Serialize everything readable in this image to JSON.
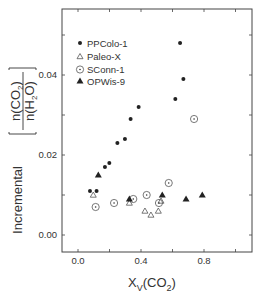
{
  "chart_data": {
    "type": "scatter",
    "title": "",
    "xlabel": "X_V(CO2)",
    "ylabel": "Incremental [n(CO2)/n(H2O)]",
    "xlim": [
      -0.1,
      1.105
    ],
    "ylim": [
      -0.0043,
      0.0565
    ],
    "xticks": [
      0.0,
      0.2,
      0.4,
      0.6,
      0.8,
      1.0
    ],
    "xtick_labels": [
      "0.0",
      "0.4",
      "0.8"
    ],
    "yticks": [
      0.0,
      0.01,
      0.02,
      0.03,
      0.04,
      0.05
    ],
    "ytick_labels": [
      "0.00",
      "0.02",
      "0.04"
    ],
    "grid": false,
    "legend_position": "upper left",
    "series": [
      {
        "name": "PPColo-1",
        "marker": "filled-circle",
        "points": [
          [
            0.076,
            0.011
          ],
          [
            0.118,
            0.011
          ],
          [
            0.171,
            0.017
          ],
          [
            0.199,
            0.018
          ],
          [
            0.25,
            0.023
          ],
          [
            0.298,
            0.024
          ],
          [
            0.334,
            0.029
          ],
          [
            0.385,
            0.032
          ],
          [
            0.618,
            0.034
          ],
          [
            0.648,
            0.048
          ],
          [
            0.669,
            0.039
          ]
        ]
      },
      {
        "name": "Paleo-X",
        "marker": "open-triangle",
        "points": [
          [
            0.097,
            0.01
          ],
          [
            0.326,
            0.008
          ],
          [
            0.425,
            0.006
          ],
          [
            0.463,
            0.005
          ],
          [
            0.51,
            0.006
          ],
          [
            0.527,
            0.0085
          ]
        ]
      },
      {
        "name": "SConn-1",
        "marker": "dotted-circle",
        "points": [
          [
            0.112,
            0.007
          ],
          [
            0.229,
            0.008
          ],
          [
            0.351,
            0.009
          ],
          [
            0.436,
            0.01
          ],
          [
            0.514,
            0.008
          ],
          [
            0.576,
            0.013
          ],
          [
            0.737,
            0.029
          ]
        ]
      },
      {
        "name": "OPWis-9",
        "marker": "filled-triangle",
        "points": [
          [
            0.129,
            0.015
          ],
          [
            0.326,
            0.009
          ],
          [
            0.535,
            0.01
          ],
          [
            0.686,
            0.009
          ],
          [
            0.789,
            0.01
          ]
        ]
      }
    ]
  },
  "axes": {
    "x_title_main": "X",
    "x_title_sub": "V",
    "x_title_rest": "(CO",
    "x_title_sub2": "2",
    "x_title_close": ")",
    "y_title_word": "Incremental",
    "y_frac_num": "n(CO",
    "y_frac_num_sub": "2",
    "y_frac_num_close": ")",
    "y_frac_den": "n(H",
    "y_frac_den_sub": "2",
    "y_frac_den_close": "O)"
  },
  "style": {
    "ink": "#222222",
    "frame": "#444444"
  }
}
